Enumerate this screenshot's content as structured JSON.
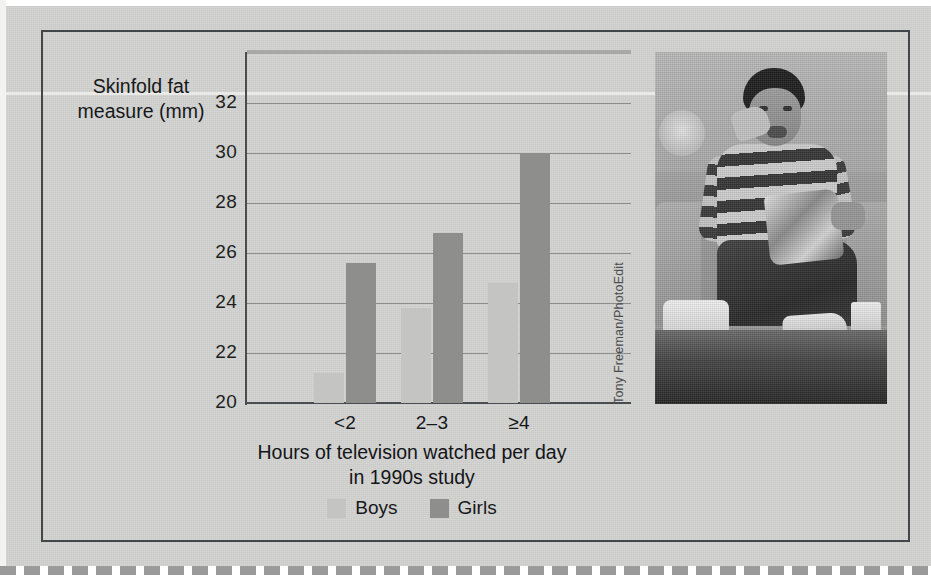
{
  "figure": {
    "photo_credit": "Tony Freeman/PhotoEdit",
    "photo_alt": "Teenage boy sitting on a couch eating snacks with popcorn and chip bag"
  },
  "chart_data": {
    "type": "bar",
    "title": "",
    "xlabel": "Hours of television watched per day in 1990s study",
    "xlabel_line1": "Hours of television watched per day",
    "xlabel_line2": "in 1990s study",
    "ylabel": "Skinfold fat measure (mm)",
    "ylabel_line1": "Skinfold fat",
    "ylabel_line2": "measure (mm)",
    "categories": [
      "<2",
      "2–3",
      "≥4"
    ],
    "series": [
      {
        "name": "Boys",
        "values": [
          21.2,
          23.8,
          24.8
        ],
        "color": "#c4c4c2"
      },
      {
        "name": "Girls",
        "values": [
          25.6,
          26.8,
          30.0
        ],
        "color": "#8e8e8c"
      }
    ],
    "ylim": [
      20,
      32
    ],
    "yticks": [
      20,
      22,
      24,
      26,
      28,
      30,
      32
    ],
    "ytick_labels": [
      "20",
      "22",
      "24",
      "26",
      "28",
      "30",
      "32"
    ],
    "grid": true,
    "legend_position": "bottom"
  }
}
